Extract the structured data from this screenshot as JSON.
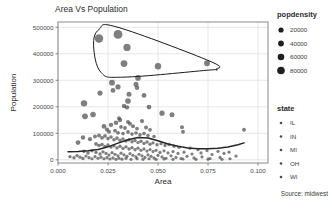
{
  "chart_data": {
    "type": "scatter",
    "title": "Area Vs Population",
    "xlabel": "Area",
    "ylabel": "Population",
    "caption": "Source: midwest",
    "xlim": [
      0.0,
      0.105
    ],
    "ylim": [
      -12000,
      520000
    ],
    "grid": true,
    "xticks": [
      0.0,
      0.025,
      0.05,
      0.075,
      0.1
    ],
    "xticklabels": [
      "0.000",
      "0.025",
      "0.050",
      "0.075",
      "0.100"
    ],
    "yticks": [
      0,
      100000,
      200000,
      300000,
      400000,
      500000
    ],
    "yticklabels": [
      "0",
      "100000",
      "200000",
      "300000",
      "400000",
      "500000"
    ],
    "size_legend": {
      "title": "popdensity",
      "position": "right-top",
      "entries": [
        {
          "label": "20000",
          "value": 20000,
          "radius": 2.6
        },
        {
          "label": "40000",
          "value": 40000,
          "radius": 2.9
        },
        {
          "label": "60000",
          "value": 60000,
          "radius": 3.3
        },
        {
          "label": "80000",
          "value": 80000,
          "radius": 3.8
        }
      ]
    },
    "color_legend": {
      "title": "state",
      "position": "right-bottom",
      "entries": [
        {
          "label": "IL"
        },
        {
          "label": "IN"
        },
        {
          "label": "MI"
        },
        {
          "label": "OH"
        },
        {
          "label": "WI"
        }
      ]
    },
    "point_color": "#4d4d4d",
    "smooth_line_color": "#262626",
    "encircle_color": "#1a1a1a",
    "encircle_note": "convex hull around high-population counties",
    "encircle_hull": [
      [
        0.0205,
        492000
      ],
      [
        0.03,
        500000
      ],
      [
        0.076,
        372000
      ],
      [
        0.079,
        342000
      ],
      [
        0.0745,
        338000
      ],
      [
        0.033,
        312000
      ],
      [
        0.0215,
        330000
      ],
      [
        0.0178,
        430000
      ]
    ],
    "smooth_line": [
      [
        0.005,
        30500
      ],
      [
        0.01,
        31500
      ],
      [
        0.015,
        34000
      ],
      [
        0.02,
        39000
      ],
      [
        0.025,
        49000
      ],
      [
        0.03,
        63000
      ],
      [
        0.035,
        76000
      ],
      [
        0.04,
        84000
      ],
      [
        0.045,
        82000
      ],
      [
        0.05,
        72000
      ],
      [
        0.055,
        60000
      ],
      [
        0.06,
        51000
      ],
      [
        0.065,
        45000
      ],
      [
        0.07,
        42000
      ],
      [
        0.075,
        41500
      ],
      [
        0.08,
        43500
      ],
      [
        0.085,
        48500
      ],
      [
        0.09,
        57000
      ],
      [
        0.093,
        64000
      ]
    ],
    "points": [
      {
        "x": 0.0205,
        "y": 458000,
        "r": 4.2
      },
      {
        "x": 0.03,
        "y": 473000,
        "r": 4.4
      },
      {
        "x": 0.0345,
        "y": 424000,
        "r": 3.6
      },
      {
        "x": 0.033,
        "y": 363000,
        "r": 3.4
      },
      {
        "x": 0.05,
        "y": 353000,
        "r": 3.2
      },
      {
        "x": 0.0745,
        "y": 364000,
        "r": 3.0
      },
      {
        "x": 0.027,
        "y": 291000,
        "r": 2.9
      },
      {
        "x": 0.03,
        "y": 275000,
        "r": 2.6
      },
      {
        "x": 0.0275,
        "y": 262000,
        "r": 2.4
      },
      {
        "x": 0.04,
        "y": 309000,
        "r": 2.8
      },
      {
        "x": 0.039,
        "y": 285000,
        "r": 2.5
      },
      {
        "x": 0.0395,
        "y": 272000,
        "r": 2.3
      },
      {
        "x": 0.021,
        "y": 252000,
        "r": 2.6
      },
      {
        "x": 0.0355,
        "y": 247000,
        "r": 2.5
      },
      {
        "x": 0.043,
        "y": 243000,
        "r": 2.4
      },
      {
        "x": 0.013,
        "y": 213000,
        "r": 3.2
      },
      {
        "x": 0.035,
        "y": 222000,
        "r": 2.8
      },
      {
        "x": 0.033,
        "y": 203000,
        "r": 2.2
      },
      {
        "x": 0.0345,
        "y": 198000,
        "r": 2.2
      },
      {
        "x": 0.0455,
        "y": 199000,
        "r": 2.4
      },
      {
        "x": 0.052,
        "y": 176000,
        "r": 2.6
      },
      {
        "x": 0.057,
        "y": 170000,
        "r": 2.5
      },
      {
        "x": 0.0175,
        "y": 171000,
        "r": 2.8
      },
      {
        "x": 0.0135,
        "y": 164000,
        "r": 2.9
      },
      {
        "x": 0.0305,
        "y": 157000,
        "r": 2.0
      },
      {
        "x": 0.031,
        "y": 150000,
        "r": 2.2
      },
      {
        "x": 0.035,
        "y": 143000,
        "r": 2.0
      },
      {
        "x": 0.036,
        "y": 136000,
        "r": 2.0
      },
      {
        "x": 0.042,
        "y": 146000,
        "r": 2.1
      },
      {
        "x": 0.029,
        "y": 140000,
        "r": 2.3
      },
      {
        "x": 0.0265,
        "y": 132000,
        "r": 2.2
      },
      {
        "x": 0.023,
        "y": 126000,
        "r": 2.4
      },
      {
        "x": 0.0315,
        "y": 124000,
        "r": 1.9
      },
      {
        "x": 0.0335,
        "y": 120000,
        "r": 1.9
      },
      {
        "x": 0.0375,
        "y": 127000,
        "r": 2.0
      },
      {
        "x": 0.0395,
        "y": 118000,
        "r": 1.9
      },
      {
        "x": 0.044,
        "y": 122000,
        "r": 2.0
      },
      {
        "x": 0.046,
        "y": 113000,
        "r": 1.9
      },
      {
        "x": 0.062,
        "y": 123000,
        "r": 2.0
      },
      {
        "x": 0.0625,
        "y": 106000,
        "r": 1.9
      },
      {
        "x": 0.093,
        "y": 113000,
        "r": 2.0
      },
      {
        "x": 0.0245,
        "y": 114000,
        "r": 2.1
      },
      {
        "x": 0.0255,
        "y": 106000,
        "r": 2.0
      },
      {
        "x": 0.0285,
        "y": 110000,
        "r": 1.9
      },
      {
        "x": 0.03,
        "y": 102000,
        "r": 1.9
      },
      {
        "x": 0.0325,
        "y": 99000,
        "r": 1.8
      },
      {
        "x": 0.035,
        "y": 105000,
        "r": 1.9
      },
      {
        "x": 0.037,
        "y": 97000,
        "r": 1.8
      },
      {
        "x": 0.039,
        "y": 101000,
        "r": 1.8
      },
      {
        "x": 0.041,
        "y": 94000,
        "r": 1.8
      },
      {
        "x": 0.043,
        "y": 99000,
        "r": 1.8
      },
      {
        "x": 0.045,
        "y": 92000,
        "r": 1.8
      },
      {
        "x": 0.048,
        "y": 88000,
        "r": 1.8
      },
      {
        "x": 0.01,
        "y": 65000,
        "r": 2.4
      },
      {
        "x": 0.0125,
        "y": 84000,
        "r": 2.2
      },
      {
        "x": 0.016,
        "y": 78000,
        "r": 2.1
      },
      {
        "x": 0.0185,
        "y": 88000,
        "r": 2.0
      },
      {
        "x": 0.0205,
        "y": 92000,
        "r": 2.0
      },
      {
        "x": 0.022,
        "y": 83000,
        "r": 1.9
      },
      {
        "x": 0.0235,
        "y": 90000,
        "r": 1.9
      },
      {
        "x": 0.025,
        "y": 80000,
        "r": 1.8
      },
      {
        "x": 0.0265,
        "y": 86000,
        "r": 1.8
      },
      {
        "x": 0.028,
        "y": 76000,
        "r": 1.8
      },
      {
        "x": 0.0295,
        "y": 82000,
        "r": 1.8
      },
      {
        "x": 0.031,
        "y": 74000,
        "r": 1.8
      },
      {
        "x": 0.0325,
        "y": 79000,
        "r": 1.7
      },
      {
        "x": 0.034,
        "y": 71000,
        "r": 1.7
      },
      {
        "x": 0.0355,
        "y": 76000,
        "r": 1.7
      },
      {
        "x": 0.037,
        "y": 68000,
        "r": 1.7
      },
      {
        "x": 0.0385,
        "y": 73000,
        "r": 1.7
      },
      {
        "x": 0.04,
        "y": 65000,
        "r": 1.7
      },
      {
        "x": 0.0415,
        "y": 70000,
        "r": 1.7
      },
      {
        "x": 0.043,
        "y": 62000,
        "r": 1.7
      },
      {
        "x": 0.0445,
        "y": 67000,
        "r": 1.7
      },
      {
        "x": 0.046,
        "y": 59000,
        "r": 1.7
      },
      {
        "x": 0.0475,
        "y": 64000,
        "r": 1.7
      },
      {
        "x": 0.0495,
        "y": 57000,
        "r": 1.7
      },
      {
        "x": 0.0515,
        "y": 61000,
        "r": 1.7
      },
      {
        "x": 0.0535,
        "y": 54000,
        "r": 1.7
      },
      {
        "x": 0.0555,
        "y": 58000,
        "r": 1.7
      },
      {
        "x": 0.058,
        "y": 51000,
        "r": 1.7
      },
      {
        "x": 0.0605,
        "y": 47000,
        "r": 1.7
      },
      {
        "x": 0.066,
        "y": 44000,
        "r": 1.7
      },
      {
        "x": 0.07,
        "y": 38000,
        "r": 1.6
      },
      {
        "x": 0.0745,
        "y": 35000,
        "r": 1.6
      },
      {
        "x": 0.08,
        "y": 32000,
        "r": 1.6
      },
      {
        "x": 0.0855,
        "y": 29000,
        "r": 1.6
      },
      {
        "x": 0.019,
        "y": 60000,
        "r": 1.9
      },
      {
        "x": 0.0205,
        "y": 54000,
        "r": 1.8
      },
      {
        "x": 0.022,
        "y": 58000,
        "r": 1.8
      },
      {
        "x": 0.0235,
        "y": 50000,
        "r": 1.8
      },
      {
        "x": 0.025,
        "y": 56000,
        "r": 1.7
      },
      {
        "x": 0.0265,
        "y": 48000,
        "r": 1.7
      },
      {
        "x": 0.028,
        "y": 53000,
        "r": 1.7
      },
      {
        "x": 0.0295,
        "y": 45000,
        "r": 1.7
      },
      {
        "x": 0.031,
        "y": 51000,
        "r": 1.7
      },
      {
        "x": 0.0325,
        "y": 43000,
        "r": 1.7
      },
      {
        "x": 0.034,
        "y": 49000,
        "r": 1.7
      },
      {
        "x": 0.0355,
        "y": 41000,
        "r": 1.7
      },
      {
        "x": 0.037,
        "y": 46000,
        "r": 1.7
      },
      {
        "x": 0.0385,
        "y": 38000,
        "r": 1.7
      },
      {
        "x": 0.04,
        "y": 44000,
        "r": 1.7
      },
      {
        "x": 0.0415,
        "y": 36000,
        "r": 1.6
      },
      {
        "x": 0.043,
        "y": 41000,
        "r": 1.6
      },
      {
        "x": 0.0445,
        "y": 33000,
        "r": 1.6
      },
      {
        "x": 0.046,
        "y": 39000,
        "r": 1.6
      },
      {
        "x": 0.0475,
        "y": 31000,
        "r": 1.6
      },
      {
        "x": 0.049,
        "y": 36000,
        "r": 1.6
      },
      {
        "x": 0.051,
        "y": 28000,
        "r": 1.6
      },
      {
        "x": 0.053,
        "y": 34000,
        "r": 1.6
      },
      {
        "x": 0.055,
        "y": 26000,
        "r": 1.6
      },
      {
        "x": 0.0575,
        "y": 31000,
        "r": 1.6
      },
      {
        "x": 0.06,
        "y": 24000,
        "r": 1.6
      },
      {
        "x": 0.063,
        "y": 29000,
        "r": 1.6
      },
      {
        "x": 0.067,
        "y": 22000,
        "r": 1.6
      },
      {
        "x": 0.0715,
        "y": 26000,
        "r": 1.6
      },
      {
        "x": 0.077,
        "y": 20000,
        "r": 1.6
      },
      {
        "x": 0.083,
        "y": 24000,
        "r": 1.6
      },
      {
        "x": 0.089,
        "y": 14000,
        "r": 1.6
      },
      {
        "x": 0.013,
        "y": 32000,
        "r": 1.8
      },
      {
        "x": 0.015,
        "y": 26000,
        "r": 1.8
      },
      {
        "x": 0.017,
        "y": 34000,
        "r": 1.7
      },
      {
        "x": 0.019,
        "y": 28000,
        "r": 1.7
      },
      {
        "x": 0.021,
        "y": 22000,
        "r": 1.7
      },
      {
        "x": 0.0225,
        "y": 30000,
        "r": 1.7
      },
      {
        "x": 0.024,
        "y": 24000,
        "r": 1.6
      },
      {
        "x": 0.0255,
        "y": 18000,
        "r": 1.6
      },
      {
        "x": 0.027,
        "y": 27000,
        "r": 1.6
      },
      {
        "x": 0.0285,
        "y": 21000,
        "r": 1.6
      },
      {
        "x": 0.03,
        "y": 15000,
        "r": 1.6
      },
      {
        "x": 0.0315,
        "y": 25000,
        "r": 1.6
      },
      {
        "x": 0.033,
        "y": 19000,
        "r": 1.6
      },
      {
        "x": 0.0345,
        "y": 13000,
        "r": 1.6
      },
      {
        "x": 0.036,
        "y": 23000,
        "r": 1.6
      },
      {
        "x": 0.0375,
        "y": 17000,
        "r": 1.6
      },
      {
        "x": 0.039,
        "y": 11000,
        "r": 1.6
      },
      {
        "x": 0.0405,
        "y": 21000,
        "r": 1.6
      },
      {
        "x": 0.042,
        "y": 15000,
        "r": 1.6
      },
      {
        "x": 0.0435,
        "y": 9000,
        "r": 1.6
      },
      {
        "x": 0.045,
        "y": 19000,
        "r": 1.6
      },
      {
        "x": 0.0465,
        "y": 13000,
        "r": 1.6
      },
      {
        "x": 0.048,
        "y": 7000,
        "r": 1.6
      },
      {
        "x": 0.05,
        "y": 17000,
        "r": 1.6
      },
      {
        "x": 0.052,
        "y": 11000,
        "r": 1.6
      },
      {
        "x": 0.054,
        "y": 6000,
        "r": 1.6
      },
      {
        "x": 0.0565,
        "y": 15000,
        "r": 1.6
      },
      {
        "x": 0.059,
        "y": 9000,
        "r": 1.6
      },
      {
        "x": 0.0615,
        "y": 5000,
        "r": 1.6
      },
      {
        "x": 0.0645,
        "y": 13000,
        "r": 1.6
      },
      {
        "x": 0.068,
        "y": 7000,
        "r": 1.6
      },
      {
        "x": 0.072,
        "y": 11000,
        "r": 1.6
      },
      {
        "x": 0.076,
        "y": 5000,
        "r": 1.6
      },
      {
        "x": 0.081,
        "y": 9000,
        "r": 1.6
      },
      {
        "x": 0.086,
        "y": 4000,
        "r": 1.6
      },
      {
        "x": 0.006,
        "y": 12000,
        "r": 1.7
      },
      {
        "x": 0.008,
        "y": 8000,
        "r": 1.7
      },
      {
        "x": 0.0095,
        "y": 16000,
        "r": 1.7
      },
      {
        "x": 0.011,
        "y": 10000,
        "r": 1.7
      },
      {
        "x": 0.0125,
        "y": 5000,
        "r": 1.7
      },
      {
        "x": 0.014,
        "y": 14000,
        "r": 1.6
      },
      {
        "x": 0.0155,
        "y": 8000,
        "r": 1.6
      },
      {
        "x": 0.017,
        "y": 4000,
        "r": 1.6
      },
      {
        "x": 0.0185,
        "y": 12000,
        "r": 1.6
      },
      {
        "x": 0.02,
        "y": 6000,
        "r": 1.6
      },
      {
        "x": 0.0215,
        "y": 10000,
        "r": 1.6
      },
      {
        "x": 0.023,
        "y": 4000,
        "r": 1.6
      },
      {
        "x": 0.0245,
        "y": 8000,
        "r": 1.6
      },
      {
        "x": 0.026,
        "y": 3000,
        "r": 1.6
      },
      {
        "x": 0.0275,
        "y": 7000,
        "r": 1.6
      },
      {
        "x": 0.029,
        "y": 2000,
        "r": 1.6
      },
      {
        "x": 0.0305,
        "y": 6000,
        "r": 1.6
      },
      {
        "x": 0.032,
        "y": 2500,
        "r": 1.6
      },
      {
        "x": 0.034,
        "y": 5500,
        "r": 1.6
      },
      {
        "x": 0.0365,
        "y": 2000,
        "r": 1.6
      },
      {
        "x": 0.0395,
        "y": 4500,
        "r": 1.6
      },
      {
        "x": 0.0425,
        "y": 2000,
        "r": 1.6
      },
      {
        "x": 0.0455,
        "y": 4000,
        "r": 1.6
      },
      {
        "x": 0.049,
        "y": 2000,
        "r": 1.6
      },
      {
        "x": 0.053,
        "y": 3500,
        "r": 1.6
      },
      {
        "x": 0.0575,
        "y": 2000,
        "r": 1.6
      },
      {
        "x": 0.0625,
        "y": 3000,
        "r": 1.6
      },
      {
        "x": 0.069,
        "y": 2000,
        "r": 1.6
      },
      {
        "x": 0.075,
        "y": 2500,
        "r": 1.6
      },
      {
        "x": 0.082,
        "y": 2000,
        "r": 1.6
      }
    ]
  }
}
